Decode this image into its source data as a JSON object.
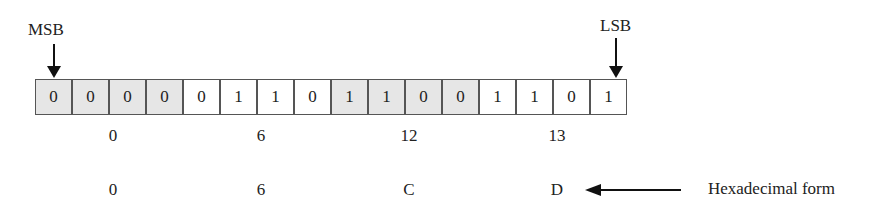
{
  "msb_label": "MSB",
  "lsb_label": "LSB",
  "bits": [
    {
      "value": "0",
      "shaded": true
    },
    {
      "value": "0",
      "shaded": true
    },
    {
      "value": "0",
      "shaded": true
    },
    {
      "value": "0",
      "shaded": true
    },
    {
      "value": "0",
      "shaded": false
    },
    {
      "value": "1",
      "shaded": false
    },
    {
      "value": "1",
      "shaded": false
    },
    {
      "value": "0",
      "shaded": false
    },
    {
      "value": "1",
      "shaded": true
    },
    {
      "value": "1",
      "shaded": true
    },
    {
      "value": "0",
      "shaded": true
    },
    {
      "value": "0",
      "shaded": true
    },
    {
      "value": "1",
      "shaded": false
    },
    {
      "value": "1",
      "shaded": false
    },
    {
      "value": "0",
      "shaded": false
    },
    {
      "value": "1",
      "shaded": false
    }
  ],
  "decimal_groups": [
    "0",
    "6",
    "12",
    "13"
  ],
  "hex_groups": [
    "0",
    "6",
    "C",
    "D"
  ],
  "hex_label": "Hexadecimal form"
}
